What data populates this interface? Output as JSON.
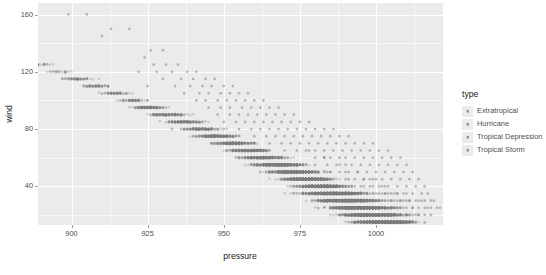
{
  "chart_data": {
    "type": "scatter",
    "title": "",
    "xlabel": "pressure",
    "ylabel": "wind",
    "xlim": [
      889,
      1022
    ],
    "ylim": [
      13,
      168
    ],
    "x_ticks": [
      900,
      925,
      950,
      975,
      1000
    ],
    "y_ticks": [
      40,
      80,
      120,
      160
    ],
    "x_minor_ticks": [
      887.5,
      912.5,
      937.5,
      962.5,
      987.5,
      1012.5
    ],
    "y_minor_ticks": [
      20,
      60,
      100,
      140
    ],
    "grid": true,
    "legend_position": "right",
    "legend_title": "type",
    "point_color": "#7f7f7f",
    "point_opacity": 0.3,
    "point_radius": 1.35,
    "panel_background": "#ebebeb",
    "grid_major_color": "#ffffff",
    "grid_minor_color": "#f7f7f7",
    "series": [
      {
        "name": "Extratropical",
        "color": "#7f7f7f",
        "points": [
          [
            1005,
            25
          ],
          [
            1008,
            30
          ],
          [
            1002,
            35
          ],
          [
            999,
            40
          ],
          [
            996,
            45
          ],
          [
            1000,
            30
          ],
          [
            1003,
            25
          ],
          [
            994,
            50
          ],
          [
            991,
            45
          ],
          [
            1007,
            25
          ],
          [
            1010,
            20
          ],
          [
            997,
            35
          ],
          [
            1001,
            30
          ],
          [
            1004,
            35
          ],
          [
            988,
            55
          ],
          [
            985,
            50
          ],
          [
            1006,
            30
          ],
          [
            1009,
            25
          ],
          [
            993,
            40
          ],
          [
            998,
            45
          ],
          [
            1002,
            40
          ],
          [
            983,
            60
          ],
          [
            980,
            55
          ],
          [
            1011,
            20
          ],
          [
            1012,
            25
          ],
          [
            995,
            35
          ],
          [
            990,
            50
          ],
          [
            1005,
            35
          ],
          [
            978,
            65
          ],
          [
            1013,
            20
          ],
          [
            1000,
            45
          ],
          [
            996,
            40
          ],
          [
            992,
            35
          ],
          [
            1008,
            25
          ],
          [
            1014,
            20
          ],
          [
            1001,
            35
          ],
          [
            1004,
            30
          ],
          [
            1007,
            35
          ],
          [
            1010,
            30
          ],
          [
            999,
            30
          ],
          [
            1003,
            40
          ],
          [
            1006,
            25
          ]
        ]
      },
      {
        "name": "Hurricane",
        "color": "#7f7f7f",
        "points": [
          [
            899,
            160
          ],
          [
            905,
            160
          ],
          [
            913,
            150
          ],
          [
            919,
            150
          ],
          [
            910,
            145
          ],
          [
            926,
            135
          ],
          [
            930,
            135
          ],
          [
            924,
            130
          ],
          [
            927,
            125
          ],
          [
            931,
            125
          ],
          [
            935,
            125
          ],
          [
            922,
            120
          ],
          [
            928,
            120
          ],
          [
            933,
            120
          ],
          [
            938,
            120
          ],
          [
            941,
            120
          ],
          [
            936,
            115
          ],
          [
            940,
            115
          ],
          [
            944,
            115
          ],
          [
            947,
            115
          ],
          [
            930,
            115
          ],
          [
            934,
            110
          ],
          [
            939,
            110
          ],
          [
            943,
            110
          ],
          [
            946,
            110
          ],
          [
            950,
            110
          ],
          [
            953,
            110
          ],
          [
            925,
            110
          ],
          [
            937,
            105
          ],
          [
            942,
            105
          ],
          [
            945,
            105
          ],
          [
            949,
            105
          ],
          [
            952,
            105
          ],
          [
            955,
            105
          ],
          [
            958,
            105
          ],
          [
            941,
            100
          ],
          [
            944,
            100
          ],
          [
            948,
            100
          ],
          [
            951,
            100
          ],
          [
            954,
            100
          ],
          [
            957,
            100
          ],
          [
            960,
            100
          ],
          [
            963,
            100
          ],
          [
            945,
            95
          ],
          [
            949,
            95
          ],
          [
            952,
            95
          ],
          [
            956,
            95
          ],
          [
            959,
            95
          ],
          [
            962,
            95
          ],
          [
            965,
            95
          ],
          [
            968,
            95
          ],
          [
            948,
            90
          ],
          [
            952,
            90
          ],
          [
            955,
            90
          ],
          [
            958,
            90
          ],
          [
            961,
            90
          ],
          [
            964,
            90
          ],
          [
            967,
            90
          ],
          [
            970,
            90
          ],
          [
            973,
            90
          ],
          [
            950,
            85
          ],
          [
            954,
            85
          ],
          [
            957,
            85
          ],
          [
            960,
            85
          ],
          [
            963,
            85
          ],
          [
            966,
            85
          ],
          [
            969,
            85
          ],
          [
            972,
            85
          ],
          [
            975,
            85
          ],
          [
            978,
            85
          ],
          [
            955,
            80
          ],
          [
            959,
            80
          ],
          [
            962,
            80
          ],
          [
            965,
            80
          ],
          [
            968,
            80
          ],
          [
            971,
            80
          ],
          [
            974,
            80
          ],
          [
            977,
            80
          ],
          [
            980,
            80
          ],
          [
            983,
            80
          ],
          [
            986,
            80
          ],
          [
            960,
            75
          ],
          [
            964,
            75
          ],
          [
            967,
            75
          ],
          [
            970,
            75
          ],
          [
            973,
            75
          ],
          [
            976,
            75
          ],
          [
            979,
            75
          ],
          [
            982,
            75
          ],
          [
            985,
            75
          ],
          [
            988,
            75
          ],
          [
            991,
            75
          ],
          [
            965,
            70
          ],
          [
            969,
            70
          ],
          [
            972,
            70
          ],
          [
            975,
            70
          ],
          [
            978,
            70
          ],
          [
            981,
            70
          ],
          [
            984,
            70
          ],
          [
            987,
            70
          ],
          [
            990,
            70
          ],
          [
            993,
            70
          ],
          [
            996,
            70
          ],
          [
            999,
            70
          ],
          [
            970,
            65
          ],
          [
            974,
            65
          ],
          [
            977,
            65
          ],
          [
            980,
            65
          ],
          [
            983,
            65
          ],
          [
            986,
            65
          ],
          [
            989,
            65
          ],
          [
            992,
            65
          ],
          [
            995,
            65
          ],
          [
            998,
            65
          ],
          [
            1001,
            65
          ],
          [
            1004,
            65
          ]
        ]
      },
      {
        "name": "Tropical Depression",
        "color": "#7f7f7f",
        "points": [
          [
            1004,
            25
          ],
          [
            1006,
            25
          ],
          [
            1008,
            25
          ],
          [
            1010,
            25
          ],
          [
            1012,
            25
          ],
          [
            1014,
            25
          ],
          [
            1016,
            25
          ],
          [
            1002,
            25
          ],
          [
            1000,
            25
          ],
          [
            1005,
            30
          ],
          [
            1007,
            30
          ],
          [
            1009,
            30
          ],
          [
            1011,
            30
          ],
          [
            1013,
            30
          ],
          [
            1015,
            30
          ],
          [
            1003,
            30
          ],
          [
            1001,
            30
          ],
          [
            999,
            30
          ],
          [
            1017,
            25
          ],
          [
            1018,
            25
          ],
          [
            1019,
            30
          ],
          [
            1006,
            20
          ],
          [
            1008,
            20
          ],
          [
            1010,
            20
          ],
          [
            1012,
            20
          ],
          [
            1014,
            20
          ],
          [
            1016,
            20
          ],
          [
            1004,
            20
          ],
          [
            1002,
            20
          ],
          [
            1000,
            20
          ],
          [
            1018,
            20
          ],
          [
            1020,
            25
          ],
          [
            1021,
            25
          ],
          [
            997,
            25
          ],
          [
            995,
            25
          ]
        ]
      },
      {
        "name": "Tropical Storm",
        "color": "#7f7f7f",
        "points": [
          [
            990,
            60
          ],
          [
            993,
            60
          ],
          [
            996,
            60
          ],
          [
            999,
            60
          ],
          [
            1002,
            60
          ],
          [
            1005,
            60
          ],
          [
            1008,
            60
          ],
          [
            985,
            60
          ],
          [
            988,
            60
          ],
          [
            980,
            60
          ],
          [
            983,
            60
          ],
          [
            992,
            55
          ],
          [
            995,
            55
          ],
          [
            998,
            55
          ],
          [
            1001,
            55
          ],
          [
            1004,
            55
          ],
          [
            1007,
            55
          ],
          [
            1010,
            55
          ],
          [
            987,
            55
          ],
          [
            990,
            55
          ],
          [
            984,
            55
          ],
          [
            994,
            50
          ],
          [
            997,
            50
          ],
          [
            1000,
            50
          ],
          [
            1003,
            50
          ],
          [
            1006,
            50
          ],
          [
            1009,
            50
          ],
          [
            1012,
            50
          ],
          [
            991,
            50
          ],
          [
            988,
            50
          ],
          [
            985,
            50
          ],
          [
            996,
            45
          ],
          [
            999,
            45
          ],
          [
            1002,
            45
          ],
          [
            1005,
            45
          ],
          [
            1008,
            45
          ],
          [
            1011,
            45
          ],
          [
            1014,
            45
          ],
          [
            993,
            45
          ],
          [
            990,
            45
          ],
          [
            998,
            40
          ],
          [
            1001,
            40
          ],
          [
            1004,
            40
          ],
          [
            1007,
            40
          ],
          [
            1010,
            40
          ],
          [
            1013,
            40
          ],
          [
            1016,
            40
          ],
          [
            995,
            40
          ],
          [
            992,
            40
          ],
          [
            1000,
            35
          ],
          [
            1003,
            35
          ],
          [
            1006,
            35
          ],
          [
            1009,
            35
          ],
          [
            1012,
            35
          ],
          [
            1015,
            35
          ],
          [
            1017,
            35
          ],
          [
            997,
            35
          ],
          [
            994,
            35
          ],
          [
            1002,
            30
          ],
          [
            1005,
            30
          ],
          [
            1008,
            30
          ],
          [
            1011,
            30
          ],
          [
            1014,
            30
          ],
          [
            1016,
            30
          ],
          [
            1018,
            30
          ],
          [
            999,
            30
          ],
          [
            996,
            30
          ],
          [
            1003,
            35
          ],
          [
            1007,
            35
          ],
          [
            1010,
            35
          ]
        ]
      }
    ],
    "legend_entries": [
      "Extratropical",
      "Hurricane",
      "Tropical Depression",
      "Tropical Storm"
    ]
  },
  "axes": {
    "x": {
      "title": "pressure",
      "tick_labels": [
        "900",
        "925",
        "950",
        "975",
        "1000"
      ]
    },
    "y": {
      "title": "wind",
      "tick_labels": [
        "160",
        "120",
        "80",
        "40"
      ]
    }
  },
  "legend": {
    "title": "type",
    "items": [
      {
        "label": "Extratropical",
        "key": "legend-key-square"
      },
      {
        "label": "Hurricane",
        "key": "legend-key-square"
      },
      {
        "label": "Tropical Depression",
        "key": "legend-key-square"
      },
      {
        "label": "Tropical Storm",
        "key": "legend-key-square"
      }
    ]
  }
}
